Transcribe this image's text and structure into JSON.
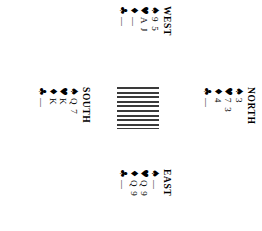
{
  "diagram": {
    "kind": "bridge-hand-diagram",
    "orientation": "rotated-90-clockwise",
    "empty_suit": "—",
    "suit_pips": {
      "spade": "♠",
      "heart": "♥",
      "diamond": "♦",
      "club": "♣"
    },
    "hands": {
      "west": {
        "label": "WEST",
        "suits": [
          {
            "pip": "♠",
            "name": "spades",
            "cards": "9 5"
          },
          {
            "pip": "♥",
            "name": "hearts",
            "cards": "A J"
          },
          {
            "pip": "♦",
            "name": "diamonds",
            "cards": "—"
          },
          {
            "pip": "♣",
            "name": "clubs",
            "cards": "—"
          }
        ]
      },
      "north": {
        "label": "NORTH",
        "suits": [
          {
            "pip": "♠",
            "name": "spades",
            "cards": "3"
          },
          {
            "pip": "♥",
            "name": "hearts",
            "cards": "7 3"
          },
          {
            "pip": "♦",
            "name": "diamonds",
            "cards": "4"
          },
          {
            "pip": "♣",
            "name": "clubs",
            "cards": "—"
          }
        ]
      },
      "south": {
        "label": "SOUTH",
        "suits": [
          {
            "pip": "♠",
            "name": "spades",
            "cards": "Q 7"
          },
          {
            "pip": "♥",
            "name": "hearts",
            "cards": "K"
          },
          {
            "pip": "♦",
            "name": "diamonds",
            "cards": "K"
          },
          {
            "pip": "♣",
            "name": "clubs",
            "cards": "—"
          }
        ]
      },
      "east": {
        "label": "EAST",
        "suits": [
          {
            "pip": "♠",
            "name": "spades",
            "cards": "—"
          },
          {
            "pip": "♥",
            "name": "hearts",
            "cards": "Q 9"
          },
          {
            "pip": "♦",
            "name": "diamonds",
            "cards": "Q 9"
          },
          {
            "pip": "♣",
            "name": "clubs",
            "cards": "—"
          }
        ]
      }
    },
    "center": {
      "name": "hatched-center-box",
      "line_count": 9,
      "line_color": "#3a3a3a",
      "background_color": "#ffffff"
    }
  }
}
